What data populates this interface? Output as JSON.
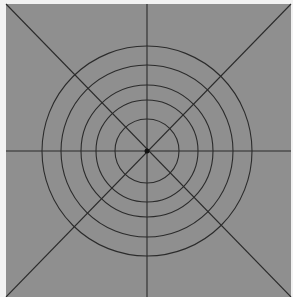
{
  "diagram": {
    "colors": {
      "page": "#f2f2f2",
      "panel": "#8f8f8f",
      "line": "#2b2b2b",
      "center": "#111111"
    },
    "panel": {
      "x": 6,
      "y": 4,
      "width": 285,
      "height": 293
    },
    "center": {
      "x": 147,
      "y": 151
    },
    "rings": [
      32,
      51,
      66,
      86,
      105
    ],
    "spokes": [
      {
        "name": "horizontal",
        "x1": 6,
        "y1": 151,
        "x2": 291,
        "y2": 151
      },
      {
        "name": "vertical",
        "x1": 147,
        "y1": 4,
        "x2": 147,
        "y2": 297
      },
      {
        "name": "diagonal-tl-br",
        "x1": 6,
        "y1": 4,
        "x2": 291,
        "y2": 297
      },
      {
        "name": "diagonal-tr-bl",
        "x1": 291,
        "y1": 4,
        "x2": 6,
        "y2": 297
      }
    ],
    "center_dot_radius": 2.5
  }
}
